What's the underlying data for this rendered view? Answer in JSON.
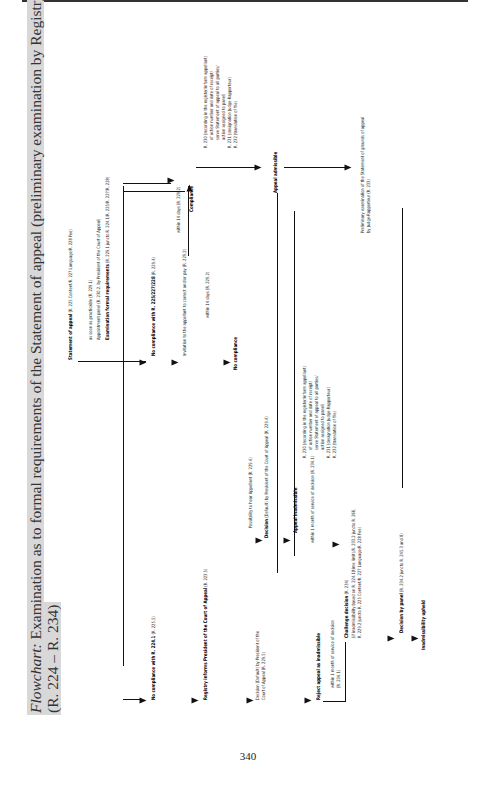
{
  "page": {
    "number": "340"
  },
  "title": {
    "italic": "Flowchart:",
    "line1": "Examination as to formal requirements of the Statement of appeal (preliminary examination by Registry)",
    "line2": "(R. 224 – R. 234)"
  },
  "nodes": {
    "statement": {
      "label": "Statement of appeal",
      "ref": "(R. 225 Content/R. 227 Language/R. 228 Fee)"
    },
    "soon": "as soon as practicable (R. 229.1)",
    "panel": "Appointment panel (R. 230.2. by President of the Court of Appeal)",
    "exam_label": "Examination formal requirements",
    "exam_ref": "(R. 229.1 juncto R. 224.1/R. 225/R. 227/R. 228)",
    "no_comp_225": {
      "label": "No compliance with R. 225/227/228",
      "ref": "(R. 229.4)"
    },
    "invitation": "Invitation to the appellant to correct and/or pay (R. 229.2)",
    "within14_a": "within 14 days (R. 229.2)",
    "within14_b": "within 14 days (R. 229.2)",
    "no_compliance": "No compliance",
    "compliance": "Compliance",
    "r230_block": [
      "R. 230  (recording in the register/inform appellant)",
      "of action number and date of receipt/",
      "serve Statement of appeal to all parties/",
      "action assigned to panel)",
      "R. 231  (designation Judge-Rapporteur)",
      "R. 232  (translation of file)"
    ],
    "r230_block_b": [
      "R. 230  (recording in the register/inform appellant)",
      "of action number and date of receipt/",
      "serve Statement of appeal to all parties/",
      "action assigned to panel)",
      "R. 231  (designation Judge-Rapporteur)",
      "R. 232  (translation of file)"
    ],
    "appeal_admissible": "Appeal admissible",
    "preliminary": [
      "Preliminary examination of the Statement of grounds of appeal",
      "by Judge-Rapporteur (R. 233)"
    ],
    "possibility": "Possibility to hear Appellant (R. 229.4)",
    "decision_default_a": {
      "label": "Decision",
      "rest": "(Default) by President of the Court of Appeal (R. 229.4)"
    },
    "appeal_inadmissible": "Appeal inadmissible",
    "within1_a": "within 1 month of service of decision (R. 234.1)",
    "challenge": {
      "label": "Challenge decision",
      "ref": "(R. 234)"
    },
    "challenge_detail": [
      "(if inadmissibility based on R. 224.1(time limit)/R. 233.2 juncto R. 266,",
      "R. 229.2 juncto R. 225 Content/R. 227 Language/R. 228 Fee)"
    ],
    "decision_panel": {
      "label": "Decision by panel",
      "ref": "(R. 234.2 juncto R. 245.3 and 8)"
    },
    "inadmissibility_upheld": "Inadmissibility upheld",
    "no_comp_224": {
      "label": "No compliance with R. 224.1",
      "ref": "(R. 225.5)"
    },
    "registry_informs": {
      "label": "Registry informs President of the Court of Appeal",
      "ref": "(R. 223.5)"
    },
    "decision_default_b": [
      "Decision (Default) by President of the",
      "Court of Appeal (R. 229.5)"
    ],
    "reject": "Reject appeal as inadmissible",
    "within1_b": [
      "within 1 month of service of decision",
      "(R. 234.1)"
    ]
  }
}
